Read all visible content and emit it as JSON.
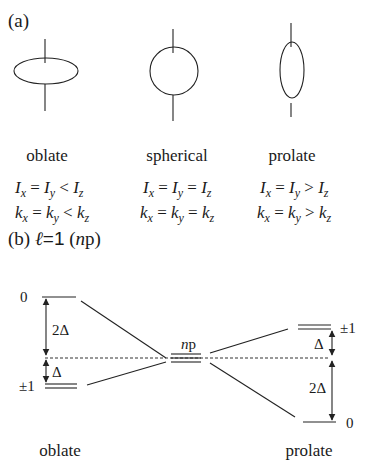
{
  "part_a": {
    "label": "(a)",
    "shapes": [
      {
        "name": "oblate",
        "label": "oblate",
        "eq1": {
          "lhs": "I",
          "text": "Ix = Iy < Iz"
        },
        "eq2": {
          "text": "kx = ky < kz"
        },
        "rel": "<"
      },
      {
        "name": "spherical",
        "label": "spherical",
        "eq1": {
          "text": "Ix = Iy = Iz"
        },
        "eq2": {
          "text": "kx = ky = kz"
        },
        "rel": "="
      },
      {
        "name": "prolate",
        "label": "prolate",
        "eq1": {
          "text": "Ix = Iy > Iz"
        },
        "eq2": {
          "text": "kx = ky > kz"
        },
        "rel": ">"
      }
    ]
  },
  "part_b": {
    "label_prefix": "(b) ",
    "ell": "ℓ",
    "ell_value": "=1",
    "paren_open": " (",
    "n": "n",
    "p": "p",
    "paren_close": ")",
    "center_label_n": "n",
    "center_label_p": "p",
    "left": {
      "caption": "oblate",
      "top_level": "0",
      "bottom_level": "±1",
      "gap_large": "2Δ",
      "gap_small": "Δ"
    },
    "right": {
      "caption": "prolate",
      "top_level": "±1",
      "bottom_level": "0",
      "gap_large": "2Δ",
      "gap_small": "Δ"
    }
  }
}
